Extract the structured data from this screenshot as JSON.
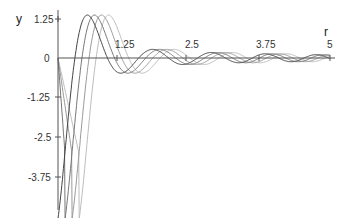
{
  "chart_data": {
    "type": "line",
    "title": "",
    "xlabel": "r",
    "ylabel": "y",
    "xlim": [
      0,
      5
    ],
    "ylim": [
      -4.9,
      1.55
    ],
    "x_ticks": [
      "1.25",
      "2.5",
      "3.75",
      "5"
    ],
    "y_ticks": [
      "1.25",
      "0",
      "-1.25",
      "-2.5",
      "-3.75"
    ],
    "grid": false,
    "legend": null,
    "series": [
      {
        "name": "curve-1",
        "color": "#444444",
        "phase": 0.0
      },
      {
        "name": "curve-2",
        "color": "#777777",
        "phase": 0.13
      },
      {
        "name": "curve-3",
        "color": "#9a9a9a",
        "phase": 0.26
      },
      {
        "name": "curve-4",
        "color": "#bdbdbd",
        "phase": 0.39
      }
    ]
  },
  "labels": {
    "y_axis": "y",
    "x_axis": "r",
    "xt1": "1.25",
    "xt2": "2.5",
    "xt3": "3.75",
    "xt4": "5",
    "yt1": "1.25",
    "yt0": "0",
    "ytm1": "-1.25",
    "ytm2": "-2.5",
    "ytm3": "-3.75"
  }
}
